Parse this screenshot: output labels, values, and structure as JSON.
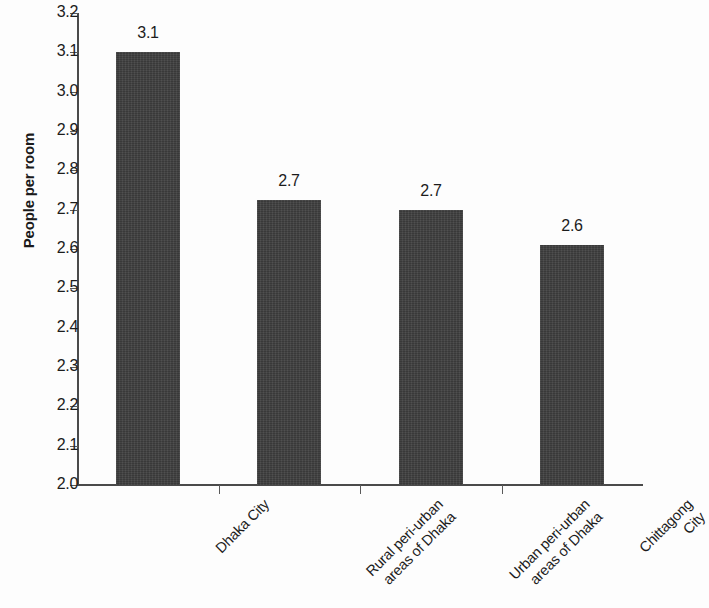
{
  "chart_data": {
    "type": "bar",
    "title": "",
    "xlabel": "",
    "ylabel": "People per room",
    "ylim": [
      2.0,
      3.2
    ],
    "ystep": 0.1,
    "grid": false,
    "legend": null,
    "categories": [
      "Dhaka City",
      "Rural peri-urban\nareas of Dhaka",
      "Urban peri-urban\nareas of Dhaka",
      "Chittagong City"
    ],
    "values": [
      3.1,
      2.725,
      2.7,
      2.61
    ],
    "data_labels": [
      "3.1",
      "2.7",
      "2.7",
      "2.6"
    ],
    "y_tick_labels": [
      "3.2",
      "3.1",
      "3.0",
      "2.9",
      "2.8",
      "2.7",
      "2.6",
      "2.5",
      "2.4",
      "2.3",
      "2.2",
      "2.1",
      "2.0"
    ],
    "bar_color": "#3e3e3e",
    "axis_color": "#4a4a4a",
    "background_color": "#fdfdfd",
    "text_color": "#1c1c1c"
  }
}
